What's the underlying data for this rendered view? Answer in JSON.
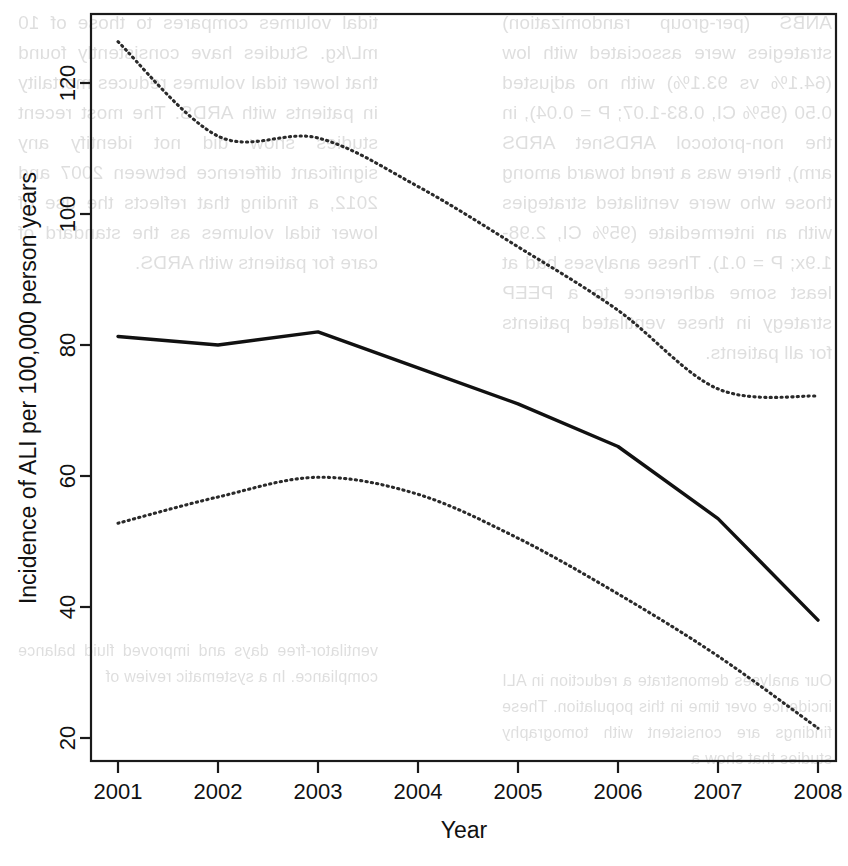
{
  "page": {
    "kind": "scanned-journal-figure",
    "background_text_note": "faint mirrored show-through text from reverse of printed page"
  },
  "bleed_text": {
    "left_column": [
      "ANBS (per-group randomization) strategies were associated with low (64.1% vs 93.1%) with no adjusted 0.50 (95% CI, 0.83-1.07; P = 0.04), in the non-protocol ARDSnet ARDS arm), there was a trend toward among those who were ventilated strategies with an intermediate (95% CI, 2.98-1.9x; P = 0.1). These analyses had at least some adherence to a PEEP strategy in these ventilated patients for all patients."
    ],
    "right_column": [
      "tidal volumes compares to those of 10 mL/kg. Studies have consistently found that lower tidal volumes reduces mortality in patients with ARDS. The most recent studies show did not identify any significant difference between 2007 and 2012, a finding that reflects the use of lower tidal volumes as the standard of care for patients with ARDS."
    ],
    "lower_left": [
      "Our analyses demonstrate a reduction in ALI incidence over time in this population. These findings are consistent with tomography studies that show a"
    ],
    "lower_right": [
      "ventilator-free days and improved fluid balance compliance. In a systematic review of"
    ]
  },
  "chart_data": {
    "type": "line",
    "title": "",
    "subtitle": "",
    "xlabel": "Year",
    "ylabel": "Incidence of ALI per 100,000 person years",
    "x": [
      2001,
      2002,
      2003,
      2004,
      2005,
      2006,
      2007,
      2008
    ],
    "xtick_labels": [
      "2001",
      "2002",
      "2003",
      "2004",
      "2005",
      "2006",
      "2007",
      "2008"
    ],
    "ytick_labels": [
      "20",
      "40",
      "60",
      "80",
      "100",
      "120"
    ],
    "yticks": [
      20,
      40,
      60,
      80,
      100,
      120
    ],
    "xlim": [
      2000.55,
      2008.5
    ],
    "ylim": [
      16.8,
      130.5
    ],
    "grid": false,
    "legend_position": "none",
    "series": [
      {
        "name": "Upper 95% confidence limit",
        "style": "dotted",
        "color": "#2a2a2a",
        "values": [
          126.3,
          111.9,
          111.6,
          104.2,
          95.0,
          85.3,
          73.3,
          72.2
        ]
      },
      {
        "name": "Estimated incidence of ALI",
        "style": "solid",
        "color": "#111111",
        "values": [
          81.3,
          80.0,
          82.0,
          76.5,
          71.0,
          64.5,
          53.5,
          38.0
        ]
      },
      {
        "name": "Lower 95% confidence limit",
        "style": "dotted",
        "color": "#2a2a2a",
        "values": [
          52.8,
          56.8,
          59.8,
          57.2,
          50.5,
          42.0,
          32.5,
          21.5
        ]
      }
    ],
    "annotations": []
  },
  "axes_geometry": {
    "plot_left_px": 91,
    "plot_right_px": 836,
    "plot_top_px": 14,
    "plot_bottom_px": 761,
    "x_first_tick_px": 118,
    "x_tick_spacing_px": 100,
    "y_value_120_px": 83,
    "y_px_per_unit": 6.55
  }
}
